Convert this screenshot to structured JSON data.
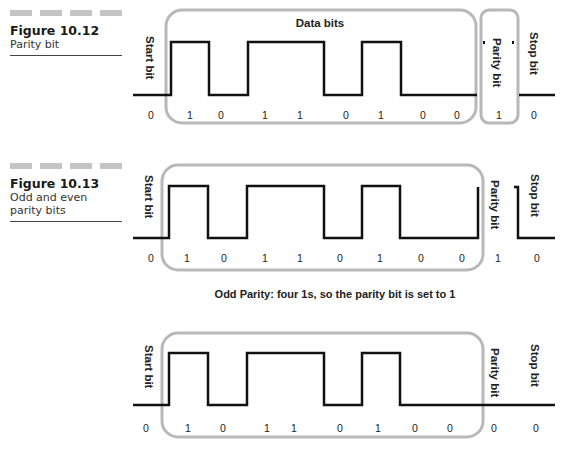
{
  "figures": [
    {
      "number": "Figure 10.12",
      "caption": "Parity bit"
    },
    {
      "number": "Figure 10.13",
      "caption": "Odd and even parity bits"
    }
  ],
  "diagram1": {
    "title": "Data bits",
    "start_label": "Start bit",
    "parity_label": "Parity bit",
    "stop_label": "Stop bit",
    "bits": [
      "0",
      "1",
      "0",
      "1",
      "1",
      "0",
      "1",
      "0",
      "0",
      "1",
      "0"
    ]
  },
  "diagram2": {
    "start_label": "Start bit",
    "parity_label": "Parity bit",
    "stop_label": "Stop bit",
    "bits": [
      "0",
      "1",
      "0",
      "1",
      "1",
      "0",
      "1",
      "0",
      "0",
      "1",
      "0"
    ],
    "caption": "Odd Parity: four 1s, so the parity bit is set to 1"
  },
  "diagram3": {
    "start_label": "Start bit",
    "parity_label": "Parity bit",
    "stop_label": "Stop bit",
    "bits": [
      "0",
      "1",
      "0",
      "1",
      "1",
      "0",
      "1",
      "0",
      "0",
      "0",
      "0"
    ]
  },
  "colors": {
    "frame": "#b8b8b8",
    "wave": "#111111",
    "dash_bar": "#c4c4c4"
  }
}
